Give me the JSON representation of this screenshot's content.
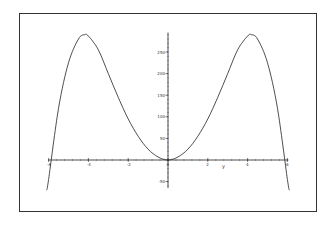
{
  "chart_data": {
    "type": "line",
    "title": "",
    "xlabel": "y",
    "ylabel": "",
    "xlim": [
      -6.1,
      6.1
    ],
    "ylim": [
      -70,
      300
    ],
    "x_ticks": [
      -6,
      -4,
      -2,
      0,
      2,
      4,
      6
    ],
    "y_ticks": [
      -50,
      50,
      100,
      150,
      200,
      250
    ],
    "grid": false,
    "legend": null,
    "series": [
      {
        "name": "curve",
        "x": [
          -6.1,
          -6,
          -5.5,
          -5,
          -4.5,
          -4.2,
          -4,
          -3.5,
          -3,
          -2.5,
          -2,
          -1.5,
          -1,
          -0.5,
          0,
          0.5,
          1,
          1.5,
          2,
          2.5,
          3,
          3.5,
          4,
          4.2,
          4.5,
          5,
          5.5,
          6,
          6.1
        ],
        "y": [
          -70,
          -45,
          120,
          225,
          280,
          290,
          287,
          255,
          200,
          145,
          95,
          55,
          25,
          7,
          0,
          7,
          25,
          55,
          95,
          145,
          200,
          255,
          287,
          290,
          280,
          225,
          120,
          -45,
          -70
        ]
      }
    ]
  }
}
